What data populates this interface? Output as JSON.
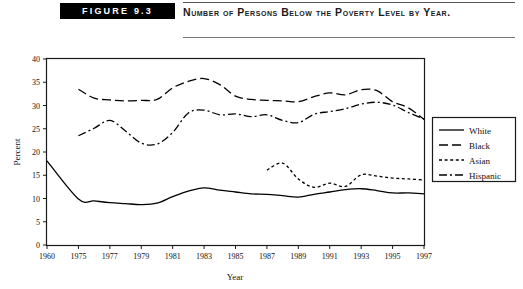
{
  "figure": {
    "badge_label": "FIGURE 9.3",
    "title": "Number of Persons Below the Poverty Level by Year."
  },
  "chart_data": {
    "type": "line",
    "title": "Number of Persons Below the Poverty Level by Year.",
    "xlabel": "Year",
    "ylabel": "Percent",
    "xlim": [
      1960,
      1997
    ],
    "ylim": [
      0,
      40
    ],
    "yticks": [
      0,
      5,
      10,
      15,
      20,
      25,
      30,
      35,
      40
    ],
    "xticks": [
      1960,
      1975,
      1977,
      1979,
      1981,
      1983,
      1985,
      1987,
      1989,
      1991,
      1993,
      1995,
      1997
    ],
    "xtick_labels": [
      "1960",
      "1975",
      "1977",
      "1979",
      "1981",
      "1983",
      "1985",
      "1987",
      "1989",
      "1991",
      "1993",
      "1995",
      "1997"
    ],
    "grid": false,
    "legend_position": "right",
    "series": [
      {
        "name": "White",
        "style": "solid",
        "x": [
          1960,
          1975,
          1976,
          1977,
          1978,
          1979,
          1980,
          1981,
          1982,
          1983,
          1984,
          1985,
          1986,
          1987,
          1988,
          1989,
          1990,
          1991,
          1992,
          1993,
          1994,
          1995,
          1996,
          1997
        ],
        "values": [
          18.1,
          9.9,
          9.5,
          9.1,
          8.9,
          8.7,
          9.0,
          10.4,
          11.6,
          12.3,
          11.8,
          11.4,
          11.0,
          10.9,
          10.6,
          10.3,
          10.9,
          11.4,
          11.9,
          12.1,
          11.7,
          11.2,
          11.2,
          11.0
        ],
        "endpoints": {
          "1960": 18.1,
          "1997": 11.0
        }
      },
      {
        "name": "Black",
        "style": "dashed",
        "x": [
          1975,
          1976,
          1977,
          1978,
          1979,
          1980,
          1981,
          1982,
          1983,
          1984,
          1985,
          1986,
          1987,
          1988,
          1989,
          1990,
          1991,
          1992,
          1993,
          1994,
          1995,
          1996,
          1997
        ],
        "values": [
          33.5,
          31.6,
          31.2,
          31.0,
          31.1,
          31.3,
          33.8,
          35.2,
          35.8,
          34.5,
          32.0,
          31.3,
          31.1,
          31.0,
          30.8,
          31.9,
          32.7,
          32.3,
          33.4,
          33.2,
          30.8,
          29.5,
          27.0
        ],
        "endpoints": {
          "1975": 33.5,
          "1997": 27.0
        }
      },
      {
        "name": "Asian",
        "style": "dotted",
        "x": [
          1987,
          1988,
          1989,
          1990,
          1991,
          1992,
          1993,
          1994,
          1995,
          1996,
          1997
        ],
        "values": [
          16.1,
          17.6,
          14.2,
          12.4,
          13.3,
          12.6,
          15.1,
          14.8,
          14.4,
          14.2,
          14.0
        ],
        "endpoints": {
          "1987": 16.1,
          "1997": 14.0
        }
      },
      {
        "name": "Hispanic",
        "style": "dashdot",
        "x": [
          1975,
          1976,
          1977,
          1978,
          1979,
          1980,
          1981,
          1982,
          1983,
          1984,
          1985,
          1986,
          1987,
          1988,
          1989,
          1990,
          1991,
          1992,
          1993,
          1994,
          1995,
          1996,
          1997
        ],
        "values": [
          23.5,
          25.1,
          26.8,
          24.5,
          21.9,
          21.7,
          24.2,
          28.4,
          29.0,
          28.0,
          28.2,
          27.6,
          28.0,
          26.8,
          26.3,
          28.1,
          28.7,
          29.3,
          30.3,
          30.7,
          30.1,
          28.5,
          27.1
        ],
        "endpoints": {
          "1975": 23.5,
          "1997": 27.1
        }
      }
    ],
    "legend_entries": [
      {
        "label": "White",
        "style": "solid"
      },
      {
        "label": "Black",
        "style": "dashed"
      },
      {
        "label": "Asian",
        "style": "dotted"
      },
      {
        "label": "Hispanic",
        "style": "dashdot"
      }
    ],
    "colors": {
      "line": "#000000",
      "frame": "#1a1a1a",
      "text": "#111111",
      "badge_bg": "#000000",
      "badge_fg": "#ffffff"
    }
  }
}
